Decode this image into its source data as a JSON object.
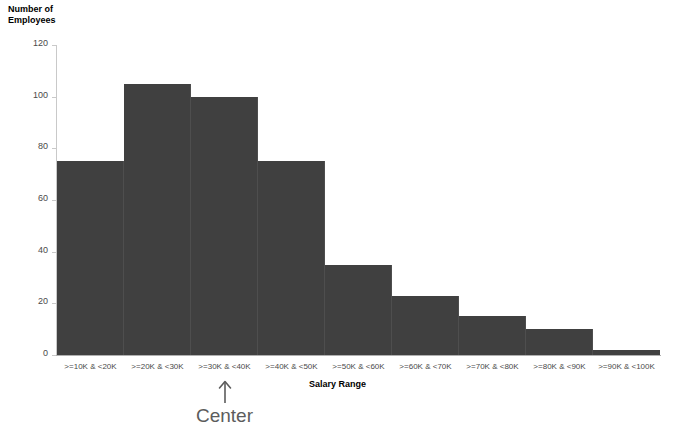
{
  "chart_data": {
    "type": "bar",
    "title": "",
    "subtitle": "",
    "xlabel": "Salary Range",
    "ylabel": "Number of\nEmployees",
    "categories": [
      ">=10K & <20K",
      ">=20K & <30K",
      ">=30K & <40K",
      ">=40K & <50K",
      ">=50K & <60K",
      ">=60K & <70K",
      ">=70K & <80K",
      ">=80K & <90K",
      ">=90K & <100K"
    ],
    "values": [
      75,
      105,
      100,
      75,
      35,
      23,
      15,
      10,
      2
    ],
    "ylim": [
      0,
      120
    ],
    "yticks": [
      0,
      20,
      40,
      60,
      80,
      100,
      120
    ],
    "ytick_labels": [
      "0",
      "20",
      "40",
      "60",
      "80",
      "100",
      "120"
    ],
    "grid": false,
    "legend": false,
    "legend_position": "none",
    "bar_color": "#404040",
    "axis_color": "#c9c9c9",
    "tick_label_color": "#4a4a4a"
  },
  "annotations": [
    {
      "name": "center-annotation",
      "label": "Center",
      "icon": "arrow-up-icon",
      "target_category": ">=30K & <40K",
      "color": "#5c5c5c"
    }
  ]
}
